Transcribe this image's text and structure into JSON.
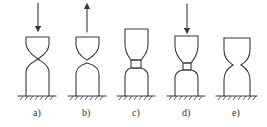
{
  "diagram": {
    "colors": {
      "line": "#3a3a3a",
      "background": "#ffffff",
      "text": "#333333"
    },
    "panels": [
      {
        "id": "a",
        "label": "a)",
        "arrow": "down",
        "state": "upper and lower bodies touching at a point"
      },
      {
        "id": "b",
        "label": "b)",
        "arrow": "up",
        "state": "bodies separated with small gap"
      },
      {
        "id": "c",
        "label": "c)",
        "arrow": "none",
        "state": "bodies joined by a bridge neck, upper body taller"
      },
      {
        "id": "d",
        "label": "d)",
        "arrow": "down",
        "state": "bodies joined by a bridge neck under compression"
      },
      {
        "id": "e",
        "label": "e)",
        "arrow": "none",
        "state": "bodies separated with pointed cusps"
      }
    ]
  }
}
